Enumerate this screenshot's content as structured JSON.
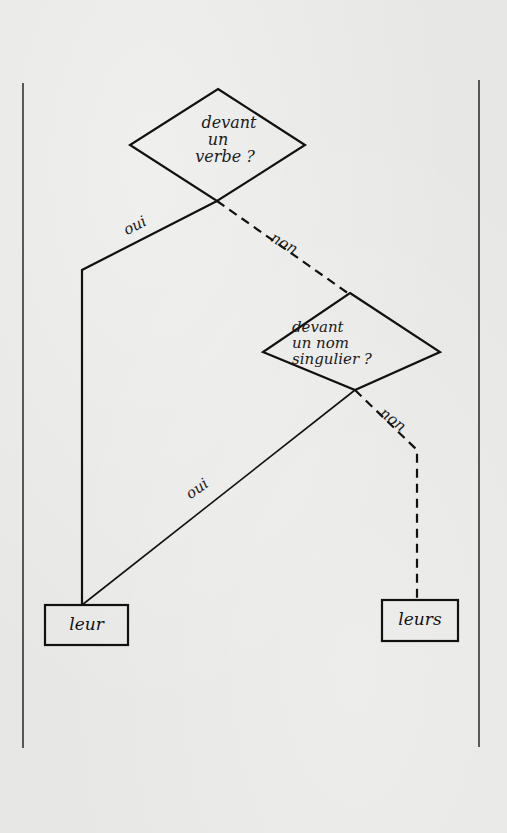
{
  "diagram": {
    "type": "decision-flowchart",
    "decisions": [
      {
        "id": "d1",
        "lines": [
          "devant",
          "un",
          "verbe ?"
        ]
      },
      {
        "id": "d2",
        "lines": [
          "devant",
          "un nom",
          "singulier ?"
        ]
      }
    ],
    "edges": [
      {
        "from": "d1",
        "to": "leur",
        "label": "oui",
        "style": "solid"
      },
      {
        "from": "d1",
        "to": "d2",
        "label": "non",
        "style": "dashed"
      },
      {
        "from": "d2",
        "to": "leur",
        "label": "oui",
        "style": "solid"
      },
      {
        "from": "d2",
        "to": "leurs",
        "label": "non",
        "style": "dashed"
      }
    ],
    "outcomes": [
      {
        "id": "leur",
        "label": "leur"
      },
      {
        "id": "leurs",
        "label": "leurs"
      }
    ]
  },
  "colors": {
    "ink": "#111111",
    "paper": "#e7e7e5"
  }
}
